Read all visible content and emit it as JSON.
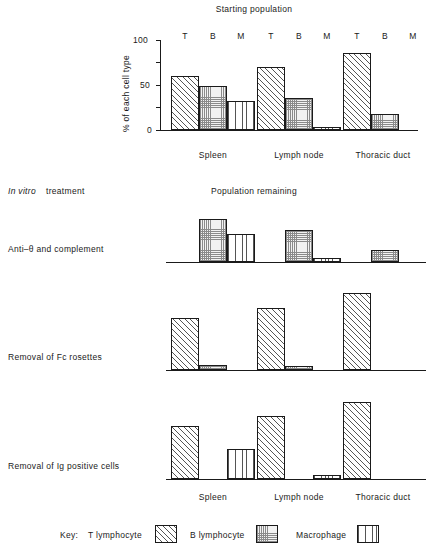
{
  "figure": {
    "top_section_title": "Starting population",
    "mid_section_title": "Population remaining",
    "treatment_header": "In vitro",
    "treatment_header_rest": "treatment",
    "y_axis_label": "% of each cell type",
    "y_ticks": [
      "100",
      "50",
      "0"
    ],
    "cell_headers": [
      "T",
      "B",
      "M"
    ],
    "groups": [
      "Spleen",
      "Lymph node",
      "Thoracic duct"
    ],
    "treatments": [
      "Anti–θ and complement",
      "Removal of Fc rosettes",
      "Removal of Ig positive cells"
    ],
    "legend": {
      "key_label": "Key:",
      "items": [
        {
          "label": "T lymphocyte",
          "pattern": "diagonal-hatch"
        },
        {
          "label": "B lymphocyte",
          "pattern": "stipple"
        },
        {
          "label": "Macrophage",
          "pattern": "vertical-lines"
        }
      ]
    },
    "colors": {
      "ink": "#1a1a1a",
      "paper": "#ffffff",
      "hatch": "#555555"
    }
  },
  "chart_data": {
    "type": "bar",
    "title": "Starting population",
    "xlabel": "",
    "ylabel": "% of each cell type",
    "ylim": [
      0,
      100
    ],
    "yticks": [
      0,
      25,
      50,
      75,
      100
    ],
    "ytick_labels": [
      "0",
      "",
      "50",
      "",
      "100"
    ],
    "grid": false,
    "legend_position": "bottom",
    "categories": [
      "Spleen",
      "Lymph node",
      "Thoracic duct"
    ],
    "series": [
      {
        "name": "T lymphocyte",
        "key": "T",
        "values": [
          60,
          70,
          86
        ]
      },
      {
        "name": "B lymphocyte",
        "key": "B",
        "values": [
          49,
          36,
          18
        ]
      },
      {
        "name": "Macrophage",
        "key": "M",
        "values": [
          32,
          3,
          0
        ]
      }
    ],
    "panels": [
      {
        "title": "Population remaining",
        "row_label": "Anti–θ and complement",
        "categories": [
          "Spleen",
          "Lymph node",
          "Thoracic duct"
        ],
        "series": [
          {
            "name": "T lymphocyte",
            "key": "T",
            "values": [
              0,
              0,
              0
            ]
          },
          {
            "name": "B lymphocyte",
            "key": "B",
            "values": [
              48,
              36,
              13
            ]
          },
          {
            "name": "Macrophage",
            "key": "M",
            "values": [
              31,
              4,
              0
            ]
          }
        ]
      },
      {
        "row_label": "Removal of Fc rosettes",
        "categories": [
          "Spleen",
          "Lymph node",
          "Thoracic duct"
        ],
        "series": [
          {
            "name": "T lymphocyte",
            "key": "T",
            "values": [
              58,
              69,
              86
            ]
          },
          {
            "name": "B lymphocyte",
            "key": "B",
            "values": [
              6,
              5,
              0
            ]
          },
          {
            "name": "Macrophage",
            "key": "M",
            "values": [
              0,
              0,
              0
            ]
          }
        ]
      },
      {
        "row_label": "Removal of Ig positive cells",
        "categories": [
          "Spleen",
          "Lymph node",
          "Thoracic duct"
        ],
        "series": [
          {
            "name": "T lymphocyte",
            "key": "T",
            "values": [
              59,
              70,
              86
            ]
          },
          {
            "name": "B lymphocyte",
            "key": "B",
            "values": [
              0,
              0,
              0
            ]
          },
          {
            "name": "Macrophage",
            "key": "M",
            "values": [
              33,
              5,
              0
            ]
          }
        ]
      }
    ]
  }
}
